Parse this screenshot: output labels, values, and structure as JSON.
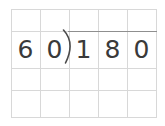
{
  "worksheet": {
    "type": "long-division-problem",
    "expression": "60)180",
    "divisor": "60",
    "dividend": "180",
    "quotient": "",
    "colors": {
      "background": "#ffffff",
      "grid_line": "#d8d8d8",
      "digit": "#3a3a3a",
      "division_bar": "#8f8f8f"
    },
    "grid": {
      "columns": 5,
      "rows": 4,
      "cells": [
        [
          "",
          "",
          "",
          "",
          ""
        ],
        [
          "6",
          "0",
          "1",
          "8",
          "0"
        ],
        [
          "",
          "",
          "",
          "",
          ""
        ],
        [
          "",
          "",
          "",
          "",
          ""
        ]
      ]
    },
    "digits": [
      {
        "value": "6",
        "column": 1
      },
      {
        "value": "0",
        "column": 2
      },
      {
        "value": "1",
        "column": 3
      },
      {
        "value": "8",
        "column": 4
      },
      {
        "value": "0",
        "column": 5
      }
    ]
  }
}
